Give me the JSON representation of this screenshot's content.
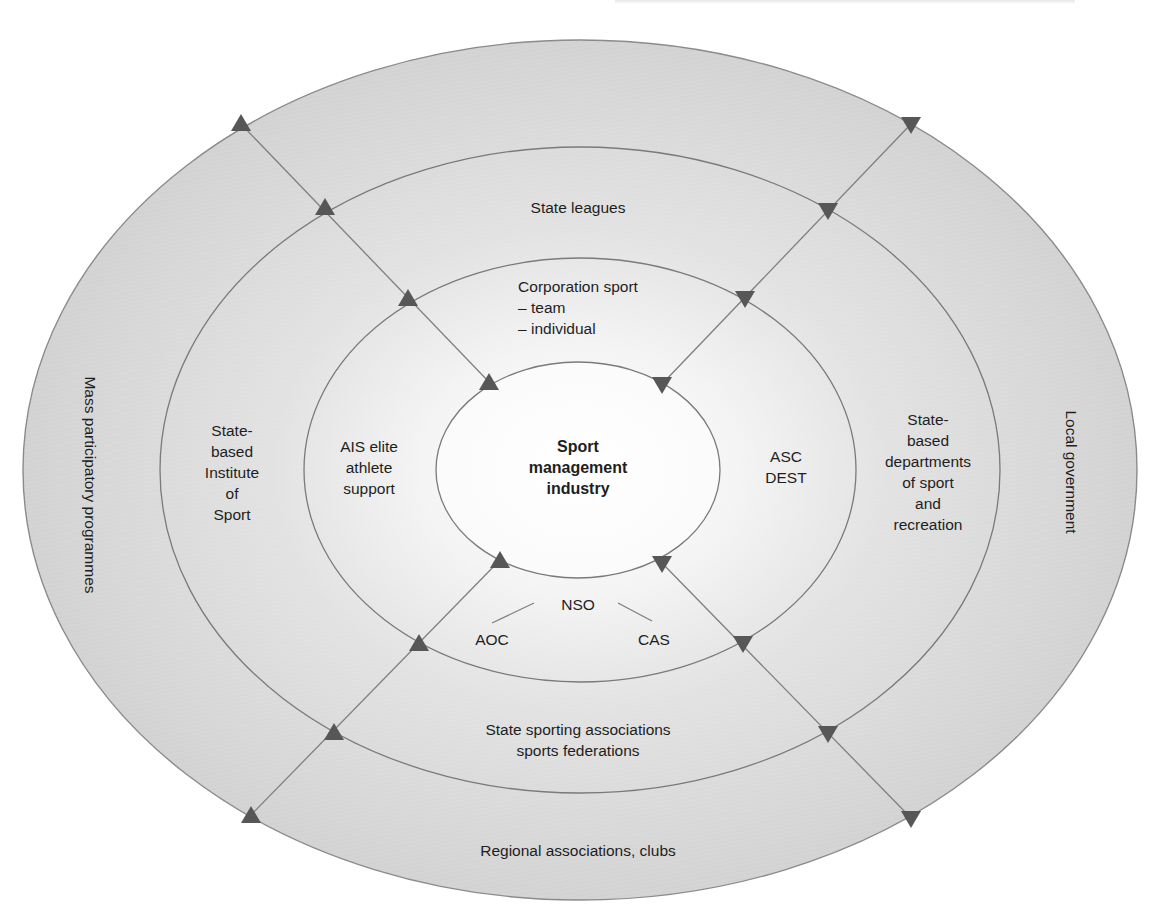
{
  "diagram": {
    "title": "Sport management industry",
    "colors": {
      "ring_fill_outer": "#d4d4d4",
      "ring_fill_center": "#ffffff",
      "ring_stroke": "#7a7a7a",
      "connector_line": "#7a7a7a",
      "triangle": "#555555"
    },
    "center": {
      "label": "Sport\nmanagement\nindustry"
    },
    "rings": [
      {
        "name": "inner-ring",
        "top": "Corporation sport\n– team\n– individual",
        "left": "AIS elite\nathlete\nsupport",
        "right": "ASC\nDEST",
        "bottom": {
          "main": "NSO",
          "left": "AOC",
          "right": "CAS"
        }
      },
      {
        "name": "middle-ring",
        "top": "State leagues",
        "left": "State-\nbased\nInstitute\nof\nSport",
        "right": "State-\nbased\ndepartments\nof sport\nand\nrecreation",
        "bottom": "State sporting associations\nsports federations"
      },
      {
        "name": "outer-ring",
        "left": "Mass participatory programmes",
        "right": "Local government",
        "bottom": "Regional associations, clubs"
      }
    ],
    "connectors": [
      {
        "name": "top-left",
        "direction": "inward",
        "triangle": "up"
      },
      {
        "name": "top-right",
        "direction": "inward",
        "triangle": "down"
      },
      {
        "name": "bottom-left",
        "direction": "inward",
        "triangle": "up"
      },
      {
        "name": "bottom-right",
        "direction": "inward",
        "triangle": "down"
      }
    ]
  }
}
